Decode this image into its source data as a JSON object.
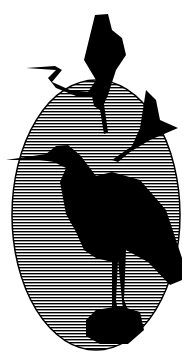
{
  "image": {
    "subject": "Three herons silhouetted in an oval with horizontal wavy line hatching",
    "colors": {
      "ink": "#000000",
      "paper": "#ffffff"
    }
  }
}
